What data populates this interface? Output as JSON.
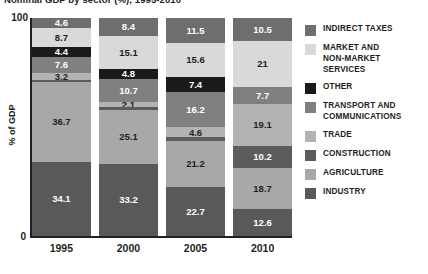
{
  "chart_data": {
    "type": "bar",
    "stacked": true,
    "title": "Nominal GDP by sector (%), 1995-2010",
    "xlabel": "",
    "ylabel": "% of GDP",
    "ylim": [
      0,
      100
    ],
    "ytick_labels": [
      "100",
      "0"
    ],
    "grid": false,
    "legend_position": "right",
    "categories": [
      "1995",
      "2000",
      "2005",
      "2010"
    ],
    "series": [
      {
        "name": "INDIRECT TAXES",
        "color": "#6e6e6e",
        "values": [
          4.6,
          8.4,
          11.5,
          10.5
        ],
        "labels": [
          "4.6",
          "8.4",
          "11.5",
          "10.5"
        ]
      },
      {
        "name": "MARKET AND\nNON-MARKET\nSERVICES",
        "color": "#d9d9d9",
        "values": [
          8.7,
          15.1,
          15.6,
          21
        ],
        "labels": [
          "8.7",
          "15.1",
          "15.6",
          "21"
        ]
      },
      {
        "name": "OTHER",
        "color": "#1a1a1a",
        "values": [
          4.4,
          4.8,
          7.4,
          0.4
        ],
        "labels": [
          "4.4",
          "4.8",
          "7.4",
          ""
        ]
      },
      {
        "name": "TRANSPORT AND\nCOMMUNICATIONS",
        "color": "#808080",
        "values": [
          7.6,
          10.7,
          16.2,
          7.7
        ],
        "labels": [
          "7.6",
          "10.7",
          "16.2",
          "7.7"
        ]
      },
      {
        "name": "TRADE",
        "color": "#b3b3b3",
        "values": [
          3.2,
          2.1,
          4.6,
          19.1
        ],
        "labels": [
          "3.2",
          "2.1",
          "4.6",
          "19.1"
        ]
      },
      {
        "name": "CONSTRUCTION",
        "color": "#5c5c5c",
        "values": [
          0.7,
          1.6,
          1.8,
          10.2
        ],
        "labels": [
          "",
          "",
          "",
          "10.2"
        ]
      },
      {
        "name": "AGRICULTURE",
        "color": "#a8a8a8",
        "values": [
          36.7,
          25.1,
          21.2,
          18.7
        ],
        "labels": [
          "36.7",
          "25.1",
          "21.2",
          "18.7"
        ]
      },
      {
        "name": "INDUSTRY",
        "color": "#595959",
        "values": [
          34.1,
          33.2,
          22.7,
          12.6
        ],
        "labels": [
          "34.1",
          "33.2",
          "22.7",
          "12.6"
        ]
      }
    ]
  },
  "legend": {
    "items": [
      {
        "label": "INDIRECT TAXES",
        "color": "#6e6e6e"
      },
      {
        "label": "MARKET AND\nNON-MARKET\nSERVICES",
        "color": "#d9d9d9"
      },
      {
        "label": "OTHER",
        "color": "#1a1a1a"
      },
      {
        "label": "TRANSPORT AND\nCOMMUNICATIONS",
        "color": "#808080"
      },
      {
        "label": "TRADE",
        "color": "#b3b3b3"
      },
      {
        "label": "CONSTRUCTION",
        "color": "#5c5c5c"
      },
      {
        "label": "AGRICULTURE",
        "color": "#a8a8a8"
      },
      {
        "label": "INDUSTRY",
        "color": "#595959"
      }
    ]
  }
}
